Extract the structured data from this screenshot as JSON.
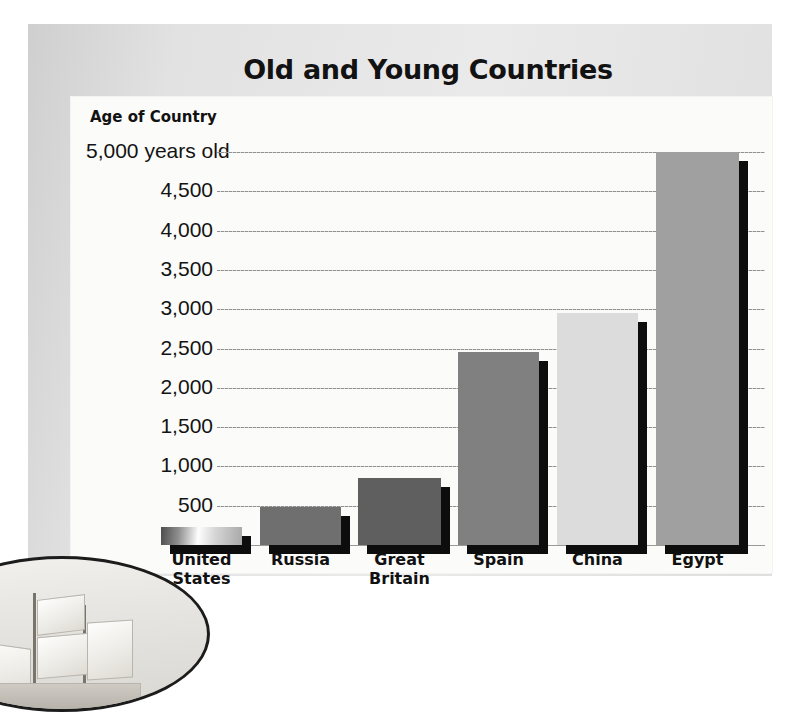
{
  "figure": {
    "title": "Old and Young Countries",
    "axis_title": "Age of Country",
    "unit_suffix": "years old",
    "tick_labels": [
      "5,000 years old",
      "4,500",
      "4,000",
      "3,500",
      "3,000",
      "2,500",
      "2,000",
      "1,500",
      "1,000",
      "500",
      "0"
    ],
    "colors": {
      "frame": "#e2e2e2",
      "panel": "#fbfbfa",
      "text": "#121212",
      "gridline": "#8b8b8b",
      "bar_shadow": "#0d0d0d"
    },
    "inset": {
      "name": "sailing-ship-illustration"
    }
  },
  "chart_data": {
    "type": "bar",
    "title": "Old and Young Countries",
    "xlabel": "",
    "ylabel": "Age of Country",
    "ylim": [
      0,
      5000
    ],
    "ytick_step": 500,
    "ytick_values": [
      0,
      500,
      1000,
      1500,
      2000,
      2500,
      3000,
      3500,
      4000,
      4500,
      5000
    ],
    "ytick_labels": [
      "0",
      "500",
      "1,000",
      "1,500",
      "2,000",
      "2,500",
      "3,000",
      "3,500",
      "4,000",
      "4,500",
      "5,000 years old"
    ],
    "grid": true,
    "legend": null,
    "categories": [
      "United States",
      "Russia",
      "Great Britain",
      "Spain",
      "China",
      "Egypt"
    ],
    "values": [
      225,
      480,
      850,
      2450,
      2950,
      5000
    ],
    "bar_colors": [
      "gradient-light",
      "#6f6f6f",
      "#5f5f5f",
      "#808080",
      "#dcdcdc",
      "#a0a0a0"
    ],
    "value_unit": "years old",
    "series": [
      {
        "name": "Age of Country",
        "values": [
          225,
          480,
          850,
          2450,
          2950,
          5000
        ]
      }
    ],
    "points": [
      {
        "category": "United States",
        "label_lines": [
          "United",
          "States"
        ],
        "value": 225
      },
      {
        "category": "Russia",
        "label_lines": [
          "Russia"
        ],
        "value": 480
      },
      {
        "category": "Great Britain",
        "label_lines": [
          "Great",
          "Britain"
        ],
        "value": 850
      },
      {
        "category": "Spain",
        "label_lines": [
          "Spain"
        ],
        "value": 2450
      },
      {
        "category": "China",
        "label_lines": [
          "China"
        ],
        "value": 2950
      },
      {
        "category": "Egypt",
        "label_lines": [
          "Egypt"
        ],
        "value": 5000
      }
    ]
  }
}
